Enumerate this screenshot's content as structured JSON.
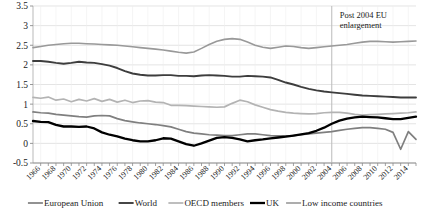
{
  "chart_data": {
    "type": "line",
    "title": "",
    "xlabel": "",
    "ylabel": "",
    "ylim": [
      -0.5,
      3.5
    ],
    "xlim": [
      1965,
      2015
    ],
    "yticks": [
      "3.5",
      "3",
      "2.5",
      "2",
      "1.5",
      "1",
      "0.5",
      "0",
      "-0.5"
    ],
    "grid": true,
    "legend_position": "bottom",
    "x": [
      1965,
      1966,
      1967,
      1968,
      1969,
      1970,
      1971,
      1972,
      1973,
      1974,
      1975,
      1976,
      1977,
      1978,
      1979,
      1980,
      1981,
      1982,
      1983,
      1984,
      1985,
      1986,
      1987,
      1988,
      1989,
      1990,
      1991,
      1992,
      1993,
      1994,
      1995,
      1996,
      1997,
      1998,
      1999,
      2000,
      2001,
      2002,
      2003,
      2004,
      2005,
      2006,
      2007,
      2008,
      2009,
      2010,
      2011,
      2012,
      2013,
      2014,
      2015
    ],
    "xtick_labels": [
      "1966",
      "1968",
      "1970",
      "1972",
      "1974",
      "1976",
      "1978",
      "1980",
      "1982",
      "1984",
      "1986",
      "1988",
      "1990",
      "1992",
      "1994",
      "1996",
      "1998",
      "2000",
      "2002",
      "2004",
      "2006",
      "2008",
      "2010",
      "2012",
      "2014"
    ],
    "annotations": [
      {
        "text_line1": "Post 2004 EU",
        "text_line2": "enlargement",
        "x": 2004,
        "vline": true
      }
    ],
    "series": [
      {
        "name": "European Union",
        "color": "#7f7f7f",
        "width": 1.7,
        "values": [
          0.8,
          0.78,
          0.77,
          0.74,
          0.72,
          0.7,
          0.68,
          0.67,
          0.7,
          0.71,
          0.7,
          0.63,
          0.58,
          0.55,
          0.52,
          0.5,
          0.48,
          0.45,
          0.42,
          0.36,
          0.3,
          0.26,
          0.24,
          0.22,
          0.21,
          0.2,
          0.2,
          0.22,
          0.24,
          0.24,
          0.22,
          0.2,
          0.19,
          0.19,
          0.2,
          0.22,
          0.24,
          0.26,
          0.28,
          0.3,
          0.33,
          0.36,
          0.38,
          0.4,
          0.4,
          0.38,
          0.36,
          0.28,
          -0.15,
          0.3,
          0.1
        ]
      },
      {
        "name": "World",
        "color": "#3d3d3d",
        "width": 1.9,
        "values": [
          2.1,
          2.1,
          2.08,
          2.05,
          2.03,
          2.05,
          2.08,
          2.06,
          2.05,
          2.02,
          1.98,
          1.92,
          1.84,
          1.78,
          1.75,
          1.73,
          1.73,
          1.74,
          1.74,
          1.72,
          1.72,
          1.71,
          1.73,
          1.74,
          1.73,
          1.72,
          1.7,
          1.7,
          1.72,
          1.71,
          1.7,
          1.68,
          1.62,
          1.55,
          1.5,
          1.44,
          1.39,
          1.35,
          1.32,
          1.3,
          1.28,
          1.26,
          1.24,
          1.22,
          1.21,
          1.2,
          1.19,
          1.18,
          1.17,
          1.17,
          1.17
        ]
      },
      {
        "name": "OECD members",
        "color": "#b3b3b3",
        "width": 1.7,
        "values": [
          1.17,
          1.15,
          1.18,
          1.1,
          1.13,
          1.06,
          1.12,
          1.08,
          1.14,
          1.07,
          1.12,
          1.05,
          1.1,
          1.04,
          1.08,
          1.09,
          1.05,
          1.04,
          0.97,
          0.97,
          0.96,
          0.95,
          0.94,
          0.93,
          0.92,
          0.93,
          1.02,
          1.1,
          1.06,
          0.98,
          0.92,
          0.86,
          0.82,
          0.79,
          0.77,
          0.76,
          0.75,
          0.76,
          0.78,
          0.79,
          0.79,
          0.77,
          0.74,
          0.72,
          0.73,
          0.74,
          0.75,
          0.76,
          0.77,
          0.78,
          0.8
        ]
      },
      {
        "name": "UK",
        "color": "#000000",
        "width": 2.3,
        "values": [
          0.57,
          0.55,
          0.54,
          0.47,
          0.43,
          0.43,
          0.42,
          0.43,
          0.38,
          0.28,
          0.22,
          0.18,
          0.12,
          0.08,
          0.05,
          0.05,
          0.08,
          0.13,
          0.12,
          0.05,
          -0.02,
          -0.06,
          0.0,
          0.07,
          0.14,
          0.16,
          0.14,
          0.1,
          0.05,
          0.08,
          0.1,
          0.13,
          0.15,
          0.17,
          0.2,
          0.23,
          0.26,
          0.32,
          0.4,
          0.5,
          0.58,
          0.63,
          0.66,
          0.68,
          0.67,
          0.66,
          0.64,
          0.62,
          0.62,
          0.65,
          0.68
        ]
      },
      {
        "name": "Low income countries",
        "color": "#999999",
        "width": 1.6,
        "values": [
          2.44,
          2.47,
          2.5,
          2.52,
          2.54,
          2.55,
          2.55,
          2.54,
          2.53,
          2.52,
          2.51,
          2.5,
          2.48,
          2.46,
          2.44,
          2.42,
          2.4,
          2.38,
          2.35,
          2.32,
          2.3,
          2.33,
          2.42,
          2.52,
          2.6,
          2.65,
          2.67,
          2.65,
          2.58,
          2.5,
          2.45,
          2.42,
          2.45,
          2.48,
          2.47,
          2.44,
          2.42,
          2.44,
          2.46,
          2.48,
          2.5,
          2.52,
          2.55,
          2.58,
          2.6,
          2.6,
          2.59,
          2.58,
          2.59,
          2.6,
          2.61
        ]
      }
    ]
  },
  "legend": {
    "items": [
      {
        "label": "European Union",
        "color": "#7f7f7f"
      },
      {
        "label": "World",
        "color": "#3d3d3d"
      },
      {
        "label": "OECD members",
        "color": "#b3b3b3"
      },
      {
        "label": "UK",
        "color": "#000000"
      },
      {
        "label": "Low income countries",
        "color": "#999999"
      }
    ]
  }
}
